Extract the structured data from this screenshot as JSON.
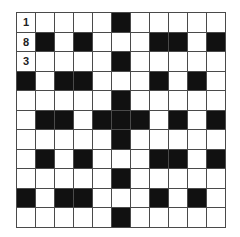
{
  "puzzle": {
    "type": "crossword",
    "rows": 11,
    "cols": 11,
    "colors": {
      "black": "#111111",
      "white": "#ffffff",
      "border": "#4a4a4a"
    },
    "grid": [
      "WWWWWBWWWWW",
      "WBWBWWWBBWB",
      "WWWWWBWWWWW",
      "BWBBWWWBWBW",
      "WWWWWBWWWWW",
      "WBBWBBBWBWB",
      "WWWWWBWWWWW",
      "WBWBWWWBBWB",
      "WWWWWBWWWWW",
      "BWBBWWWBWBW",
      "WWWWWBWWWWW"
    ],
    "filled": [
      {
        "row": 0,
        "col": 0,
        "value": "1"
      },
      {
        "row": 1,
        "col": 0,
        "value": "8"
      },
      {
        "row": 2,
        "col": 0,
        "value": "3"
      }
    ]
  }
}
